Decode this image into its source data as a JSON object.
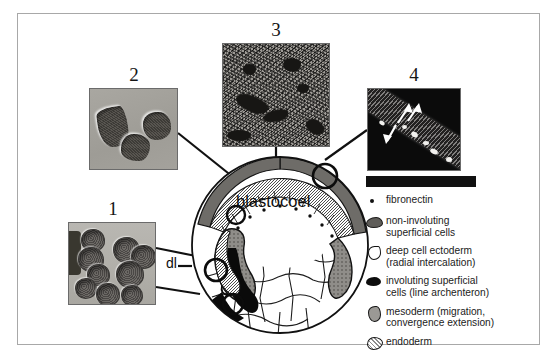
{
  "figure": {
    "background_color": "#ffffff",
    "frame_color": "#a8a8a8"
  },
  "embryo": {
    "cavity_label": "blastocoel",
    "dorsal_lip_label": "dl",
    "callout_markers": 4
  },
  "panels": [
    {
      "number": "1",
      "name": "panel-1-deep-cells",
      "description": "rounded deep cells undergoing radial intercalation",
      "background_color": "#b2b0aa"
    },
    {
      "number": "2",
      "name": "panel-2-migrating-cells",
      "description": "spread mesodermal cells migrating on fibronectin",
      "background_color": "#a4a29c"
    },
    {
      "number": "3",
      "name": "panel-3-fibronectin-matrix",
      "description": "fibrillar fibronectin matrix on blastocoel roof",
      "background_color": "#9d9a95"
    },
    {
      "number": "4",
      "name": "panel-4-blastocoel-roof",
      "description": "blastocoel roof section with arrows marking radial intercalation",
      "background_color": "#0b0b0b"
    }
  ],
  "legend": {
    "items": [
      {
        "key": "fibronectin-dot",
        "label": "fibronectin",
        "color": "#121212"
      },
      {
        "key": "non-involuting-superficial-cells",
        "label": "non-involuting\n  superficial cells",
        "color": "#5f5d59"
      },
      {
        "key": "deep-cell-ectoderm",
        "label": "deep cell ectoderm\n  (radial intercalation)",
        "color": "#ffffff"
      },
      {
        "key": "involuting-superficial-cells",
        "label": "involuting superficial\n  cells (line archenteron)",
        "color": "#0d0d0d"
      },
      {
        "key": "mesoderm",
        "label": "mesoderm (migration,\n  convergence extension)",
        "color": "#9b9995"
      },
      {
        "key": "endoderm",
        "label": "endoderm",
        "color": "#ffffff"
      }
    ]
  }
}
